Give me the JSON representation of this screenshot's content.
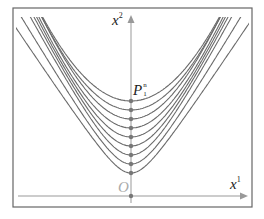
{
  "figure": {
    "frame": {
      "x": 13,
      "y": 8,
      "w": 239,
      "h": 199,
      "stroke": "#666666"
    },
    "origin": {
      "x": 131,
      "y": 196
    },
    "axis_color": "#999999",
    "curve_color": "#6b6b6b",
    "dot_color": "#777777",
    "labels": {
      "x2_axis": "x",
      "x2_sup": "2",
      "x1_axis": "x",
      "x1_sup": "1",
      "origin": "O",
      "point": "P",
      "point_sup": "n",
      "point_sub": "1"
    },
    "curves": [
      {
        "vertex_y": 101,
        "k": 900,
        "w": 200
      },
      {
        "vertex_y": 110,
        "k": 500,
        "w": 140
      },
      {
        "vertex_y": 119,
        "k": 300,
        "w": 100
      },
      {
        "vertex_y": 128,
        "k": 190,
        "w": 75
      },
      {
        "vertex_y": 137,
        "k": 125,
        "w": 56
      },
      {
        "vertex_y": 146,
        "k": 85,
        "w": 42
      },
      {
        "vertex_y": 155,
        "k": 60,
        "w": 32
      },
      {
        "vertex_y": 164,
        "k": 42,
        "w": 25
      },
      {
        "vertex_y": 173,
        "k": 30,
        "w": 20
      }
    ],
    "axis_dots_y": [
      101,
      110,
      119,
      128,
      137,
      146,
      155,
      164,
      173,
      196
    ]
  }
}
